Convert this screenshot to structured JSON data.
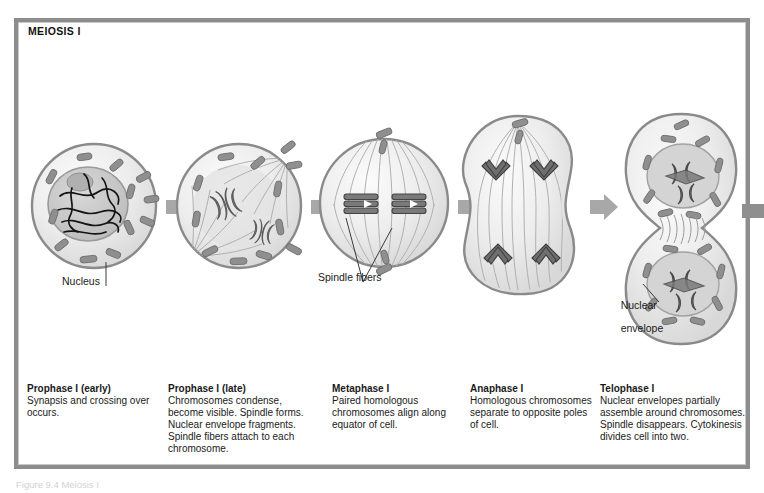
{
  "figure": {
    "panel_title": "MEIOSIS I",
    "footnote": "Figure 9.4  Meiosis I"
  },
  "callouts": [
    {
      "id": "nucleus",
      "text": "Nucleus"
    },
    {
      "id": "spindle-fibers",
      "text": "Spindle fibers"
    },
    {
      "id": "nuclear-envelope",
      "line1": "Nuclear",
      "line2": "envelope"
    }
  ],
  "stages": [
    {
      "id": "prophase-1-early",
      "title": "Prophase I (early)",
      "body": "Synapsis and crossing over occurs."
    },
    {
      "id": "prophase-1-late",
      "title": "Prophase I (late)",
      "body": "Chromosomes condense, become visible. Spindle forms. Nuclear envelope fragments. Spindle fibers attach to each chromosome."
    },
    {
      "id": "metaphase-1",
      "title": "Metaphase I",
      "body": "Paired homologous chromosomes align along equator of cell."
    },
    {
      "id": "anaphase-1",
      "title": "Anaphase I",
      "body": "Homologous chromosomes separate to opposite poles of cell."
    },
    {
      "id": "telophase-1",
      "title": "Telophase I",
      "body": "Nuclear envelopes partially assemble around chromosomes. Spindle disappears. Cytokinesis divides cell into two."
    }
  ],
  "colors": {
    "frame": "#8d8d8d",
    "arrow": "#a8a8a8",
    "cell_membrane": "#8a8a8a",
    "cytoplasm": "#ececec",
    "nucleus_fill": "#c9c9c9",
    "chromosome": "#7f7f7f",
    "chromatin": "#1a1a1a",
    "spindle_fiber": "#b4b4b4",
    "text": "#1a1a1a"
  }
}
